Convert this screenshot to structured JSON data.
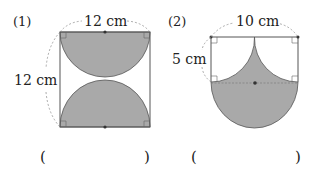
{
  "problems": [
    {
      "number": "(1)",
      "top_dimension": "12 cm",
      "side_dimension": "12 cm",
      "shape": "square with two shaded semicircles (top and bottom)",
      "answer_blank": {
        "open": "(",
        "close": ")"
      }
    },
    {
      "number": "(2)",
      "top_dimension": "10 cm",
      "side_dimension": "5 cm",
      "shape": "rectangle with two quarter-circles cut out above a shaded semicircle",
      "answer_blank": {
        "open": "(",
        "close": ")"
      }
    }
  ],
  "colors": {
    "shade": "#a9a9a9",
    "line": "#555555",
    "dashed": "#888888"
  }
}
